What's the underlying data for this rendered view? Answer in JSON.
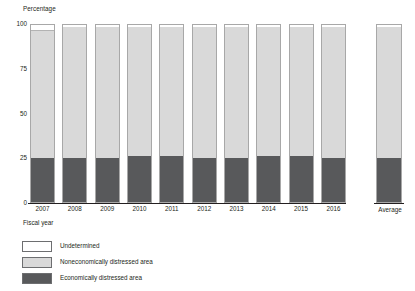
{
  "chart_data": {
    "type": "bar",
    "subtype": "stacked-100-percent",
    "title": "",
    "xlabel": "Fiscal year",
    "ylabel": "Percentage",
    "ylim": [
      0,
      100
    ],
    "yticks": [
      0,
      25,
      50,
      75,
      100
    ],
    "grid": false,
    "legend_position": "bottom-left",
    "categories": [
      "2007",
      "2008",
      "2009",
      "2010",
      "2011",
      "2012",
      "2013",
      "2014",
      "2015",
      "2016",
      "Average"
    ],
    "series": [
      {
        "name": "Economically distressed area",
        "color": "#58595b",
        "values": [
          25,
          25,
          25,
          26,
          26,
          25,
          25,
          26,
          26,
          25,
          25
        ]
      },
      {
        "name": "Noneconomically distressed area",
        "color": "#d9d9d9",
        "values": [
          72,
          74,
          74,
          73,
          73,
          74,
          74,
          73,
          73,
          74,
          74
        ]
      },
      {
        "name": "Undetermined",
        "color": "#ffffff",
        "values": [
          3,
          1,
          1,
          1,
          1,
          1,
          1,
          1,
          1,
          1,
          1
        ]
      }
    ],
    "separated_category": "Average"
  },
  "axes": {
    "y_title": "Percentage",
    "x_title": "Fiscal year",
    "y_tick_labels": [
      "100",
      "75",
      "50",
      "25",
      "0"
    ],
    "x_tick_labels": [
      "2007",
      "2008",
      "2009",
      "2010",
      "2011",
      "2012",
      "2013",
      "2014",
      "2015",
      "2016"
    ],
    "average_label": "Average"
  },
  "legend": {
    "items": [
      {
        "label": "Undetermined",
        "swatch": "white-swatch"
      },
      {
        "label": "Noneconomically distressed area",
        "swatch": "light-gray-swatch"
      },
      {
        "label": "Economically distressed area",
        "swatch": "dark-gray-swatch"
      }
    ]
  },
  "colors": {
    "distressed": "#58595b",
    "non_distressed": "#d9d9d9",
    "undetermined": "#ffffff",
    "axis": "#231f20"
  }
}
